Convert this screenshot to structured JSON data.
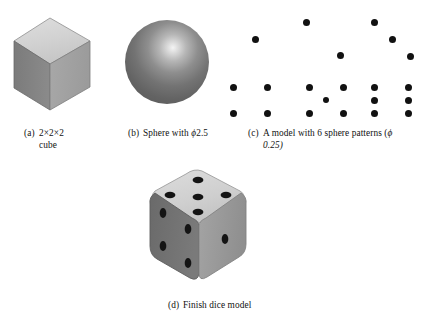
{
  "figure": {
    "background_color": "#ffffff",
    "ink_color": "#111111",
    "panels": [
      {
        "id": "a",
        "label": "(a)",
        "caption_line1": "2×2×2",
        "caption_line2": "cube",
        "object": "isometric-cube"
      },
      {
        "id": "b",
        "label": "(b)",
        "caption_line1": "Sphere with",
        "caption_symbol": "ϕ",
        "caption_value": "2.5",
        "object": "shaded-sphere"
      },
      {
        "id": "c",
        "label": "(c)",
        "caption_line1": "A model with 6 sphere patterns (",
        "caption_symbol": "ϕ",
        "caption_line2": "0.25)",
        "object": "six-dot-patterns"
      },
      {
        "id": "d",
        "label": "(d)",
        "caption_line1": "Finish dice model",
        "object": "finished-dice"
      }
    ]
  },
  "cube": {
    "top_face_color": "#d3d3d3",
    "left_face_color": "#808080",
    "right_face_color": "#a3a3a3",
    "edge_color": "#6b6b6b",
    "dimension_text": "2×2×2"
  },
  "sphere": {
    "diameter_label": "2.5",
    "symbol": "ϕ",
    "base_color": "#6e6e6e",
    "highlight_color": "#f4f4f4"
  },
  "patterns": {
    "dot_color": "#111111",
    "dot_radius_label": "0.25",
    "symbol": "ϕ",
    "count_label": "6",
    "groups": [
      {
        "name": "pattern-one",
        "pips": 1,
        "dots": [
          [
            34,
            22
          ]
        ]
      },
      {
        "name": "pattern-four",
        "pips": 4,
        "dots": [
          [
            12,
            71
          ],
          [
            46,
            71
          ],
          [
            12,
            97
          ],
          [
            46,
            97
          ]
        ]
      },
      {
        "name": "pattern-two",
        "pips": 2,
        "dots": [
          [
            84,
            4
          ],
          [
            118,
            37
          ]
        ]
      },
      {
        "name": "pattern-five",
        "pips": 5,
        "dots": [
          [
            87,
            70
          ],
          [
            121,
            70
          ],
          [
            104,
            84
          ],
          [
            87,
            97
          ],
          [
            121,
            97
          ]
        ]
      },
      {
        "name": "pattern-three",
        "pips": 3,
        "dots": [
          [
            152,
            4
          ],
          [
            170,
            21
          ],
          [
            188,
            38
          ]
        ]
      },
      {
        "name": "pattern-six",
        "pips": 6,
        "dots": [
          [
            152,
            70
          ],
          [
            186,
            70
          ],
          [
            152,
            84
          ],
          [
            186,
            84
          ],
          [
            152,
            97
          ],
          [
            186,
            97
          ]
        ]
      }
    ]
  },
  "dice": {
    "top_face_color": "#d2d2d2",
    "left_face_color": "#6f6f6f",
    "right_face_color": "#9a9a9a",
    "pip_color": "#141414",
    "top_face_pips": 5,
    "left_face_pips": 4,
    "right_face_pips": 1
  }
}
